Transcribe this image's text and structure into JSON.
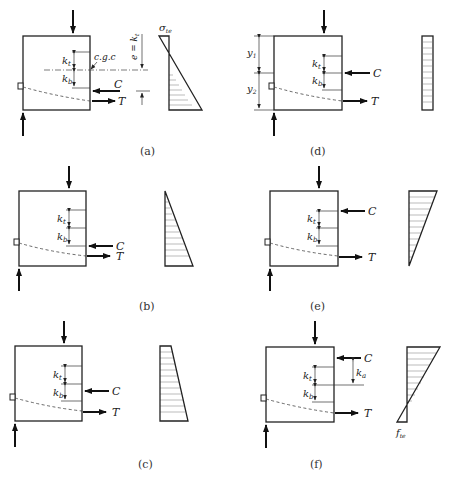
{
  "figure": {
    "panels": [
      {
        "id": "a",
        "caption": "(a)",
        "labels": {
          "kt": "k",
          "kt_sub": "t",
          "kb": "k",
          "kb_sub": "b",
          "compression": "C",
          "tension": "T",
          "centroid": "c.g.c",
          "eccentricity": "e = k",
          "eccentricity_sub": "t",
          "stress": "σ",
          "stress_sub": "te"
        },
        "stress_shape": "triangle-top-left-to-bottom-right"
      },
      {
        "id": "b",
        "caption": "(b)",
        "labels": {
          "kt": "k",
          "kt_sub": "t",
          "kb": "k",
          "kb_sub": "b",
          "compression": "C",
          "tension": "T"
        },
        "stress_shape": "triangle-zero-top"
      },
      {
        "id": "c",
        "caption": "(c)",
        "labels": {
          "kt": "k",
          "kt_sub": "t",
          "kb": "k",
          "kb_sub": "b",
          "compression": "C",
          "tension": "T"
        },
        "stress_shape": "trapezoid"
      },
      {
        "id": "d",
        "caption": "(d)",
        "labels": {
          "kt": "k",
          "kt_sub": "t",
          "kb": "k",
          "kb_sub": "b",
          "compression": "C",
          "tension": "T",
          "y1": "y",
          "y1_sub": "1",
          "y2": "y",
          "y2_sub": "2"
        },
        "stress_shape": "uniform"
      },
      {
        "id": "e",
        "caption": "(e)",
        "labels": {
          "kt": "k",
          "kt_sub": "t",
          "kb": "k",
          "kb_sub": "b",
          "compression": "C",
          "tension": "T"
        },
        "stress_shape": "triangle-zero-bottom"
      },
      {
        "id": "f",
        "caption": "(f)",
        "labels": {
          "kt": "k",
          "kt_sub": "t",
          "kb": "k",
          "kb_sub": "b",
          "compression": "C",
          "tension": "T",
          "ka": "k",
          "ka_sub": "a",
          "stress": "f",
          "stress_sub": "te"
        },
        "stress_shape": "triangle-with-tension-bottom"
      }
    ]
  }
}
